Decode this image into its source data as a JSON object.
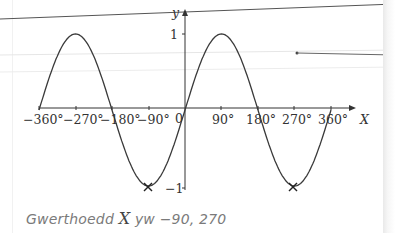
{
  "chart_data": {
    "type": "line",
    "title": "",
    "function": "y = sin X",
    "xlabel": "X",
    "ylabel": "y",
    "xlim": [
      -360,
      360
    ],
    "ylim": [
      -1,
      1
    ],
    "x_ticks": [
      -360,
      -270,
      -180,
      -90,
      0,
      90,
      180,
      270,
      360
    ],
    "x_tick_labels": [
      "−360°",
      "−270°",
      "−180°",
      "−90°",
      "0",
      "90°",
      "180°",
      "270°",
      "360°"
    ],
    "y_ticks": [
      1,
      -1
    ],
    "y_tick_labels": [
      "1",
      "−1"
    ],
    "series": [
      {
        "name": "sin X",
        "x": [
          -360,
          -270,
          -180,
          -90,
          0,
          90,
          180,
          270,
          360
        ],
        "y": [
          0,
          1,
          0,
          -1,
          0,
          1,
          0,
          -1,
          0
        ]
      }
    ],
    "marked_points": [
      {
        "x": -90,
        "y": -1,
        "marker": "cross"
      },
      {
        "x": 270,
        "y": -1,
        "marker": "cross"
      }
    ],
    "grid": false
  },
  "axes": {
    "x_label": "X",
    "y_label": "y",
    "origin_label": "0",
    "y_tick_top": "1",
    "y_tick_bottom": "−1",
    "x_ticks": [
      "−360°",
      "−270°",
      "−180°",
      "−90°",
      "90°",
      "180°",
      "270°",
      "360°"
    ]
  },
  "answer": {
    "prefix": "Gwerthoedd ",
    "variable": "X",
    "suffix": " yw −90, 270"
  },
  "colors": {
    "curve": "#3a3a3a",
    "axis": "#333333",
    "ruled_line": "#555555",
    "faint_line": "#cccccc",
    "answer_text": "#7a7a7a"
  }
}
